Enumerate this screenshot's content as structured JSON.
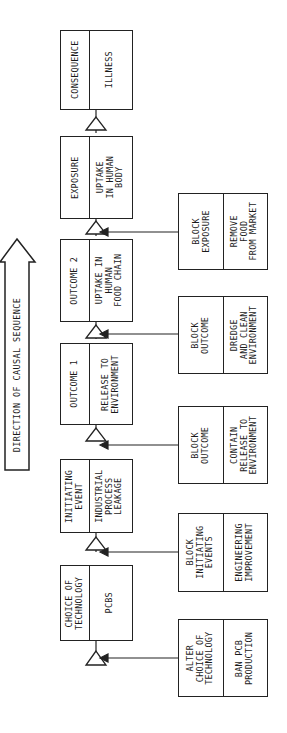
{
  "direction_arrow": {
    "label": "DIRECTION OF CAUSAL SEQUENCE"
  },
  "chain": [
    {
      "stage": "CONSEQUENCE",
      "value": "ILLNESS"
    },
    {
      "stage": "EXPOSURE",
      "value": "UPTAKE\nIN HUMAN\nBODY"
    },
    {
      "stage": "OUTCOME 2",
      "value": "UPTAKE IN\nHUMAN\nFOOD CHAIN"
    },
    {
      "stage": "OUTCOME 1",
      "value": "RELEASE TO\nENVIRONMENT"
    },
    {
      "stage": "INITIATING\nEVENT",
      "value": "INDUSTRIAL\nPROCESS\nLEAKAGE"
    },
    {
      "stage": "CHOICE OF\nTECHNOLOGY",
      "value": "PCBS"
    }
  ],
  "interventions": [
    {
      "action": "BLOCK\nEXPOSURE",
      "example": "REMOVE\nFOOD\nFROM MARKET"
    },
    {
      "action": "BLOCK\nOUTCOME",
      "example": "DREDGE\nAND CLEAN\nENVIRONMENT"
    },
    {
      "action": "BLOCK\nOUTCOME",
      "example": "CONTAIN\nRELEASE TO\nENVIRONMENT"
    },
    {
      "action": "BLOCK\nINITIATING\nEVENTS",
      "example": "ENGINEERING\nIMPROVEMENT"
    },
    {
      "action": "ALTER\nCHOICE OF\nTECHNOLOGY",
      "example": "BAN PCB\nPRODUCTION"
    }
  ]
}
